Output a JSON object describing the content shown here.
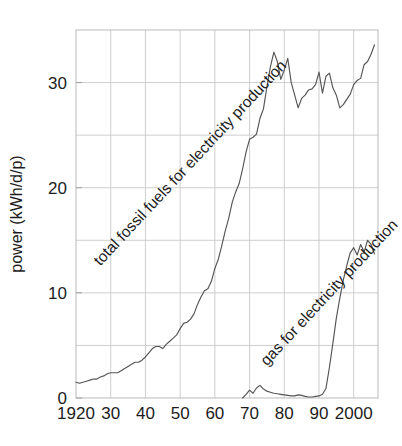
{
  "chart_data": {
    "type": "line",
    "title": "",
    "xlabel": "",
    "ylabel": "power (kWh/d/p)",
    "xlim": [
      1920,
      2007
    ],
    "ylim": [
      0,
      35
    ],
    "grid": true,
    "legend_position": "inline-annotations",
    "xticks": [
      1920,
      1930,
      1940,
      1950,
      1960,
      1970,
      1980,
      1990,
      2000
    ],
    "xticklabels": [
      "1920",
      "30",
      "40",
      "50",
      "60",
      "70",
      "80",
      "90",
      "2000"
    ],
    "yticks": [
      0,
      10,
      20,
      30
    ],
    "yticklabels": [
      "0",
      "10",
      "20",
      "30"
    ],
    "y_minor_gridlines": [
      5,
      15,
      25
    ],
    "annotations": [
      {
        "name": "total-fossil-fuels-label",
        "text": "total fossil fuels for electricity production",
        "rotation": -47,
        "x": 1927,
        "y": 12.5
      },
      {
        "name": "gas-label",
        "text": "gas for electricity production",
        "rotation": -47,
        "x": 1975,
        "y": 3.0
      }
    ],
    "series": [
      {
        "name": "total fossil fuels for electricity production",
        "color": "#555555",
        "x": [
          1920,
          1921,
          1922,
          1923,
          1924,
          1925,
          1926,
          1927,
          1928,
          1929,
          1930,
          1931,
          1932,
          1933,
          1934,
          1935,
          1936,
          1937,
          1938,
          1939,
          1940,
          1941,
          1942,
          1943,
          1944,
          1945,
          1946,
          1947,
          1948,
          1949,
          1950,
          1951,
          1952,
          1953,
          1954,
          1955,
          1956,
          1957,
          1958,
          1959,
          1960,
          1961,
          1962,
          1963,
          1964,
          1965,
          1966,
          1967,
          1968,
          1969,
          1970,
          1971,
          1972,
          1973,
          1974,
          1975,
          1976,
          1977,
          1978,
          1979,
          1980,
          1981,
          1982,
          1983,
          1984,
          1985,
          1986,
          1987,
          1988,
          1989,
          1990,
          1991,
          1992,
          1993,
          1994,
          1995,
          1996,
          1997,
          1998,
          1999,
          2000,
          2001,
          2002,
          2003,
          2004,
          2005,
          2006
        ],
        "values": [
          1.5,
          1.4,
          1.5,
          1.6,
          1.7,
          1.8,
          1.8,
          2.0,
          2.1,
          2.3,
          2.4,
          2.4,
          2.4,
          2.6,
          2.8,
          3.0,
          3.2,
          3.4,
          3.4,
          3.6,
          3.9,
          4.3,
          4.7,
          4.9,
          4.9,
          4.7,
          5.1,
          5.4,
          5.7,
          6.0,
          6.6,
          7.1,
          7.2,
          7.5,
          8.0,
          8.9,
          9.6,
          10.2,
          10.4,
          11.1,
          12.3,
          13.2,
          14.5,
          15.9,
          17.1,
          18.6,
          19.6,
          20.4,
          21.8,
          23.4,
          24.6,
          24.8,
          25.1,
          26.6,
          27.5,
          29.6,
          31.5,
          32.9,
          32.0,
          30.3,
          31.2,
          32.3,
          30.0,
          28.8,
          27.6,
          28.5,
          28.8,
          29.3,
          29.4,
          29.8,
          31.0,
          29.0,
          30.6,
          30.9,
          29.5,
          28.8,
          27.6,
          27.9,
          28.4,
          28.9,
          29.8,
          30.2,
          30.4,
          31.7,
          32.0,
          32.7,
          33.6
        ]
      },
      {
        "name": "gas for electricity production",
        "color": "#555555",
        "x": [
          1968,
          1969,
          1970,
          1971,
          1972,
          1973,
          1974,
          1975,
          1976,
          1977,
          1978,
          1979,
          1980,
          1981,
          1982,
          1983,
          1984,
          1985,
          1986,
          1987,
          1988,
          1989,
          1990,
          1991,
          1992,
          1993,
          1994,
          1995,
          1996,
          1997,
          1998,
          1999,
          2000,
          2001,
          2002,
          2003,
          2004,
          2005,
          2006
        ],
        "values": [
          0.0,
          0.35,
          0.75,
          0.45,
          0.95,
          1.2,
          0.85,
          0.65,
          0.55,
          0.45,
          0.4,
          0.35,
          0.3,
          0.25,
          0.2,
          0.2,
          0.3,
          0.25,
          0.15,
          0.1,
          0.1,
          0.15,
          0.2,
          0.35,
          0.9,
          2.9,
          5.2,
          7.6,
          9.5,
          11.2,
          12.6,
          13.8,
          14.3,
          13.6,
          14.6,
          13.9,
          15.0,
          14.6,
          13.7
        ]
      }
    ]
  }
}
